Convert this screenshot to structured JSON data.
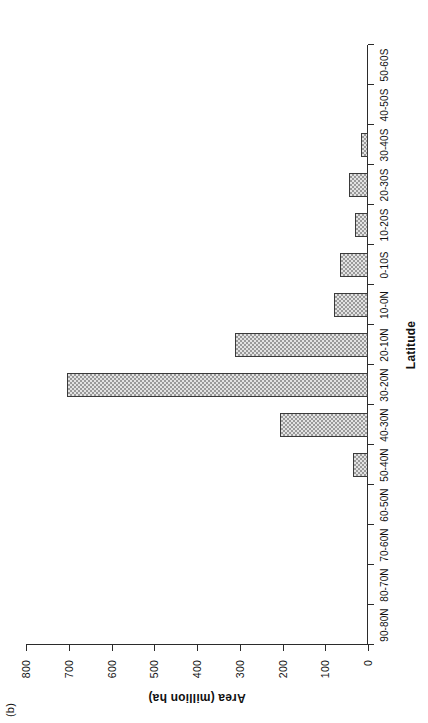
{
  "figure": {
    "panel_label": "(b)"
  },
  "chart_data": {
    "type": "bar",
    "orientation": "vertical",
    "title": "",
    "subtitle": "",
    "panel": "(b)",
    "xlabel": "Latitude",
    "ylabel": "Area (million ha)",
    "categories": [
      "90-80N",
      "80-70N",
      "70-60N",
      "60-50N",
      "50-40N",
      "40-30N",
      "30-20N",
      "20-10N",
      "10-0N",
      "0-10S",
      "10-20S",
      "20-30S",
      "30-40S",
      "40-50S",
      "50-60S"
    ],
    "values": [
      0,
      0,
      0,
      0,
      35,
      207,
      703,
      312,
      80,
      66,
      30,
      45,
      16,
      0,
      0
    ],
    "ylim": [
      0,
      800
    ],
    "yticks": [
      0,
      100,
      200,
      300,
      400,
      500,
      600,
      700,
      800
    ],
    "ytick_labels": [
      "0",
      "100",
      "200",
      "300",
      "400",
      "500",
      "600",
      "700",
      "800"
    ],
    "grid": false,
    "legend": null,
    "series": [
      {
        "name": "Area",
        "values": [
          0,
          0,
          0,
          0,
          35,
          207,
          703,
          312,
          80,
          66,
          30,
          45,
          16,
          0,
          0
        ],
        "fill": "hatched-grey",
        "edge_color": "#3a3a3a"
      }
    ],
    "colors": {
      "bar_fill": "#e3e3e3",
      "bar_hatch": "#9a9a9a",
      "bar_edge": "#3a3a3a",
      "axis": "#2b2b2b",
      "text": "#111111",
      "background": "#ffffff"
    }
  }
}
